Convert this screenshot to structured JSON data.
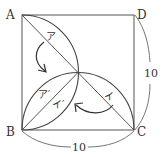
{
  "diagram": {
    "type": "geometry-square-with-quarter-arcs",
    "vertices": {
      "A": "A",
      "B": "B",
      "C": "C",
      "D": "D"
    },
    "regions": {
      "a": "ア",
      "a_prime": "ア′",
      "i": "イ",
      "i_prime": "イ′"
    },
    "dimensions": {
      "side_right": "10",
      "side_bottom": "10"
    },
    "colors": {
      "line": "#555555",
      "text": "#333333",
      "background": "#ffffff"
    }
  }
}
